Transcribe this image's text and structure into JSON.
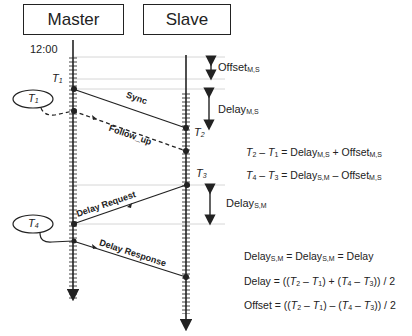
{
  "header": {
    "master_label": "Master",
    "slave_label": "Slave"
  },
  "time_label": "12:00",
  "timestamps": {
    "t1": "T",
    "t1_sub": "1",
    "t2": "T",
    "t2_sub": "2",
    "t3": "T",
    "t3_sub": "3",
    "t4": "T",
    "t4_sub": "4"
  },
  "messages": {
    "sync": "Sync",
    "follow_up": "Follow_up",
    "delay_request": "Delay Request",
    "delay_response": "Delay Response"
  },
  "intervals": {
    "offset": "Offset",
    "offset_sub": "M,S",
    "delay_ms": "Delay",
    "delay_ms_sub": "M,S",
    "delay_sm": "Delay",
    "delay_sm_sub": "S,M"
  },
  "equations": {
    "eq1_left": "– ",
    "eq1_mid": " = Delay",
    "eq1_sub1": "M,S",
    "eq1_plus": " + Offset",
    "eq1_sub2": "M,S",
    "eq2_mid": " = Delay",
    "eq2_sub1": "S,M",
    "eq2_minus": " – Offset",
    "eq2_sub2": "M,S",
    "eq3_a": "Delay",
    "eq3_sub1": "S,M",
    "eq3_b": " = Delay",
    "eq3_sub2": "S,M",
    "eq3_c": " = Delay",
    "eq4": "Delay = ((",
    "eq5": "Offset = (("
  }
}
